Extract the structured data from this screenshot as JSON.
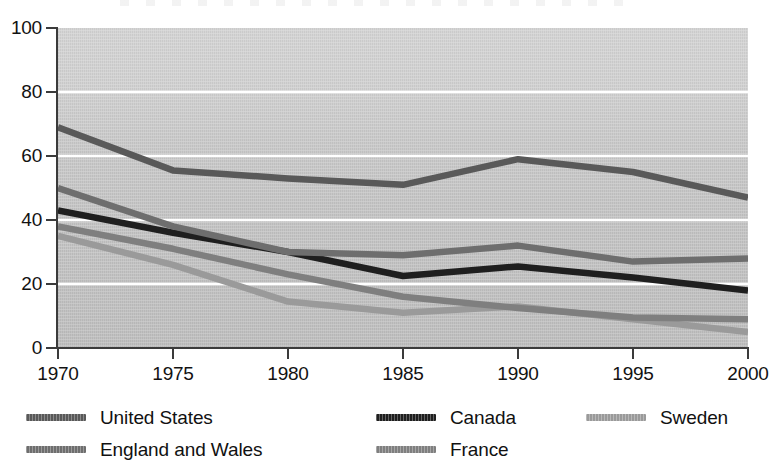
{
  "chart_data": {
    "type": "line",
    "title": "",
    "subtitle": "",
    "xlabel": "",
    "ylabel": "",
    "x": [
      1970,
      1975,
      1980,
      1985,
      1990,
      1995,
      2000
    ],
    "categories": [
      "1970",
      "1975",
      "1980",
      "1985",
      "1990",
      "1995",
      "2000"
    ],
    "xlim": [
      1970,
      2000
    ],
    "ylim": [
      0,
      100
    ],
    "yticks": [
      0,
      20,
      40,
      60,
      80,
      100
    ],
    "ytick_labels": [
      "0",
      "20",
      "40",
      "60",
      "80",
      "100"
    ],
    "xticks": [
      1970,
      1975,
      1980,
      1985,
      1990,
      1995,
      2000
    ],
    "xtick_labels": [
      "1970",
      "1975",
      "1980",
      "1985",
      "1990",
      "1995",
      "2000"
    ],
    "grid": "horizontal-white-gridlines",
    "legend_position": "below-axis",
    "legend_columns": 3,
    "plot_background": "#c7c7c7",
    "gridline_color": "#ffffff",
    "axis_color": "#3b3b3b",
    "series": [
      {
        "name": "United States",
        "color": "#595959",
        "values": [
          69,
          55.5,
          53,
          51,
          59,
          55,
          47
        ]
      },
      {
        "name": "Canada",
        "color": "#1f1f1f",
        "values": [
          43,
          36,
          30,
          22.5,
          25.5,
          22,
          18
        ]
      },
      {
        "name": "Sweden",
        "color": "#9a9a9a",
        "values": [
          35,
          26,
          14.5,
          11,
          13,
          9,
          5
        ]
      },
      {
        "name": "England and Wales",
        "color": "#6e6e6e",
        "values": [
          50,
          38,
          30,
          29,
          32,
          27,
          28
        ]
      },
      {
        "name": "France",
        "color": "#7f7f7f",
        "values": [
          38,
          31,
          23,
          16,
          12.5,
          9.5,
          9
        ]
      }
    ]
  },
  "legend": {
    "items": [
      {
        "label": "United States",
        "color": "#595959"
      },
      {
        "label": "Canada",
        "color": "#1f1f1f"
      },
      {
        "label": "Sweden",
        "color": "#9a9a9a"
      },
      {
        "label": "England and Wales",
        "color": "#6e6e6e"
      },
      {
        "label": "France",
        "color": "#7f7f7f"
      }
    ]
  }
}
